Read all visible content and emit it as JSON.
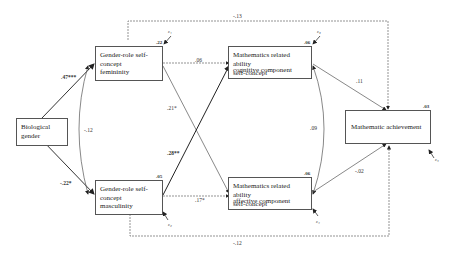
{
  "nodes": {
    "bio_gender": {
      "line1": "Biological",
      "line2": "gender"
    },
    "femininity": {
      "line1": "Gender-role self-",
      "line2": "concept",
      "sub": "femininity",
      "r2": ".22",
      "error": "ε₁"
    },
    "masculinity": {
      "line1": "Gender-role self-",
      "line2": "concept",
      "sub": "masculinity",
      "r2": ".05",
      "error": "ε₂"
    },
    "cognitive": {
      "line1": "Mathematics related ability",
      "line2": "self-concept",
      "sub": "cognitive component",
      "r2": ".06",
      "error": "ε₃"
    },
    "affective": {
      "line1": "Mathematics related ability",
      "line2": "self-concept",
      "sub": "affective component",
      "r2": ".06",
      "error": "ε₄"
    },
    "achievement": {
      "line1": "Mathematic achievement",
      "r2": ".03",
      "error": "ε₅"
    }
  },
  "paths": {
    "bio_to_fem": ".47***",
    "bio_to_masc": "-.22*",
    "fem_masc_cov": "-.12",
    "fem_to_cog": ".06",
    "fem_to_aff": ".21*",
    "masc_to_cog": ".28**",
    "masc_to_aff": ".17*",
    "cog_aff_cov": ".09",
    "cog_to_ach": ".11",
    "aff_to_ach": "-.02",
    "fem_to_ach": "-.13",
    "masc_to_ach": "-.12"
  }
}
